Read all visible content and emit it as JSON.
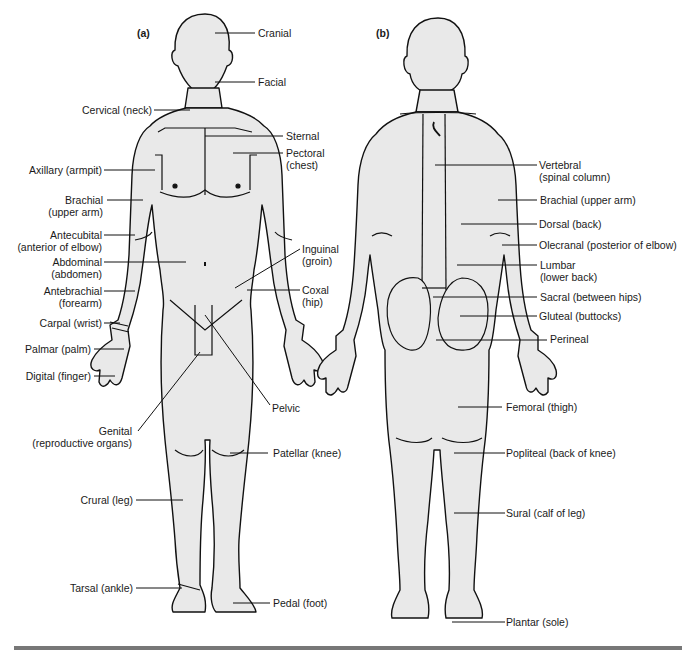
{
  "figure": {
    "body_fill": "#e9e9e9",
    "outline": "#111111",
    "rule_color": "#777777"
  },
  "panels": {
    "a": {
      "label": "(a)",
      "view": "anterior"
    },
    "b": {
      "label": "(b)",
      "view": "posterior"
    }
  },
  "anterior_labels": [
    {
      "id": "cranial",
      "line1": "Cranial",
      "line2": ""
    },
    {
      "id": "facial",
      "line1": "Facial",
      "line2": ""
    },
    {
      "id": "cervical",
      "line1": "Cervical (neck)",
      "line2": ""
    },
    {
      "id": "sternal",
      "line1": "Sternal",
      "line2": ""
    },
    {
      "id": "pectoral",
      "line1": "Pectoral",
      "line2": "(chest)"
    },
    {
      "id": "axillary",
      "line1": "Axillary (armpit)",
      "line2": ""
    },
    {
      "id": "brachial",
      "line1": "Brachial",
      "line2": "(upper arm)"
    },
    {
      "id": "antecubital",
      "line1": "Antecubital",
      "line2": "(anterior of elbow)"
    },
    {
      "id": "abdominal",
      "line1": "Abdominal",
      "line2": "(abdomen)"
    },
    {
      "id": "antebrachial",
      "line1": "Antebrachial",
      "line2": "(forearm)"
    },
    {
      "id": "carpal",
      "line1": "Carpal (wrist)",
      "line2": ""
    },
    {
      "id": "palmar",
      "line1": "Palmar (palm)",
      "line2": ""
    },
    {
      "id": "digital",
      "line1": "Digital (finger)",
      "line2": ""
    },
    {
      "id": "inguinal",
      "line1": "Inguinal",
      "line2": "(groin)"
    },
    {
      "id": "coxal",
      "line1": "Coxal",
      "line2": "(hip)"
    },
    {
      "id": "pelvic",
      "line1": "Pelvic",
      "line2": ""
    },
    {
      "id": "genital",
      "line1": "Genital",
      "line2": "(reproductive organs)"
    },
    {
      "id": "patellar",
      "line1": "Patellar (knee)",
      "line2": ""
    },
    {
      "id": "crural",
      "line1": "Crural (leg)",
      "line2": ""
    },
    {
      "id": "tarsal",
      "line1": "Tarsal (ankle)",
      "line2": ""
    },
    {
      "id": "pedal",
      "line1": "Pedal (foot)",
      "line2": ""
    }
  ],
  "posterior_labels": [
    {
      "id": "vertebral",
      "line1": "Vertebral",
      "line2": "(spinal column)"
    },
    {
      "id": "brachial",
      "line1": "Brachial (upper arm)",
      "line2": ""
    },
    {
      "id": "dorsal",
      "line1": "Dorsal (back)",
      "line2": ""
    },
    {
      "id": "olecranal",
      "line1": "Olecranal (posterior of elbow)",
      "line2": ""
    },
    {
      "id": "lumbar",
      "line1": "Lumbar",
      "line2": "(lower back)"
    },
    {
      "id": "sacral",
      "line1": "Sacral (between hips)",
      "line2": ""
    },
    {
      "id": "gluteal",
      "line1": "Gluteal (buttocks)",
      "line2": ""
    },
    {
      "id": "perineal",
      "line1": "Perineal",
      "line2": ""
    },
    {
      "id": "femoral",
      "line1": "Femoral (thigh)",
      "line2": ""
    },
    {
      "id": "popliteal",
      "line1": "Popliteal (back of knee)",
      "line2": ""
    },
    {
      "id": "sural",
      "line1": "Sural (calf of leg)",
      "line2": ""
    },
    {
      "id": "plantar",
      "line1": "Plantar (sole)",
      "line2": ""
    }
  ]
}
